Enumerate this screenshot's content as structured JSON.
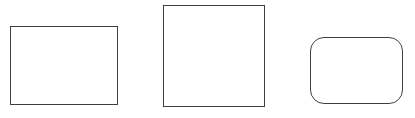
{
  "canvas": {
    "width": 415,
    "height": 118,
    "background": "#ffffff"
  },
  "shapes": [
    {
      "name": "rectangle",
      "type": "rectangle",
      "x": 10,
      "y": 26,
      "width": 108,
      "height": 79,
      "corner_radius": 0,
      "stroke_color": "#3f3f3f",
      "stroke_width": 1,
      "fill": "none"
    },
    {
      "name": "square",
      "type": "square",
      "x": 163,
      "y": 5,
      "width": 102,
      "height": 102,
      "corner_radius": 0,
      "stroke_color": "#3f3f3f",
      "stroke_width": 1,
      "fill": "none"
    },
    {
      "name": "rounded-rectangle",
      "type": "rounded-rectangle",
      "x": 310,
      "y": 37,
      "width": 93,
      "height": 67,
      "corner_radius": 14,
      "stroke_color": "#3f3f3f",
      "stroke_width": 1,
      "fill": "none"
    }
  ]
}
